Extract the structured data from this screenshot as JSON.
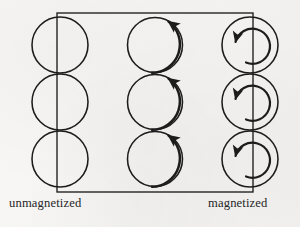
{
  "figure": {
    "type": "physics-diagram",
    "background_color": "#f3f2f0",
    "stroke_color": "#1c1c1c",
    "labels": {
      "left": "unmagnetized",
      "right": "magnetized"
    },
    "bar": {
      "description": "rectangular magnet outline",
      "x": 57,
      "y": 13,
      "width": 196,
      "height": 179,
      "stroke_width": 1.3
    },
    "columns": [
      {
        "name": "unmagnetized-column",
        "center_x": 60,
        "style": "plain-circle",
        "has_arrow": false,
        "arrow_direction": "none",
        "circle_radius": 28,
        "loops": [
          {
            "center_y": 45
          },
          {
            "center_y": 102
          },
          {
            "center_y": 159
          }
        ]
      },
      {
        "name": "middle-column",
        "center_x": 157,
        "style": "circle-with-spiral-arrow",
        "has_arrow": true,
        "arrow_direction": "counterclockwise",
        "circle_radius": 28,
        "loops": [
          {
            "center_y": 45
          },
          {
            "center_y": 102
          },
          {
            "center_y": 159
          }
        ]
      },
      {
        "name": "magnetized-column",
        "center_x": 249,
        "style": "circle-with-inner-spiral-arrow",
        "has_arrow": true,
        "arrow_direction": "counterclockwise",
        "circle_radius": 28,
        "inner_radius": 17,
        "loops": [
          {
            "center_y": 45
          },
          {
            "center_y": 102
          },
          {
            "center_y": 159
          }
        ]
      }
    ]
  }
}
